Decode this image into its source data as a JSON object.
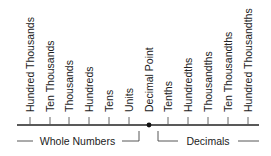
{
  "diagram": {
    "place_values": [
      {
        "label": "Hundred Thousands",
        "x": 30
      },
      {
        "label": "Ten Thousands",
        "x": 50
      },
      {
        "label": "Thousands",
        "x": 69
      },
      {
        "label": "Hundreds",
        "x": 89
      },
      {
        "label": "Tens",
        "x": 109
      },
      {
        "label": "Units",
        "x": 129
      },
      {
        "label": "Decimal Point",
        "x": 149
      },
      {
        "label": "Tenths",
        "x": 168
      },
      {
        "label": "Hundredths",
        "x": 188
      },
      {
        "label": "Thousandths",
        "x": 208
      },
      {
        "label": "Ten Thousandths",
        "x": 228
      },
      {
        "label": "Hundred Thousandths",
        "x": 248
      }
    ],
    "groups": {
      "whole": {
        "label": "Whole Numbers"
      },
      "decimals": {
        "label": "Decimals"
      }
    },
    "colors": {
      "line": "#222222",
      "text": "#222222",
      "bracket": "#444444"
    }
  }
}
